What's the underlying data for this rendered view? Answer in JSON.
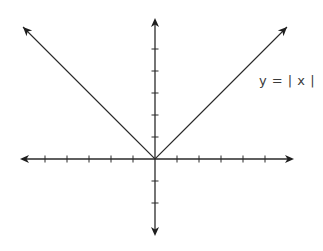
{
  "chart_data": {
    "type": "line",
    "title": "",
    "function_label": "y = | x |",
    "xlabel": "",
    "ylabel": "",
    "xlim": [
      -6,
      6
    ],
    "ylim": [
      -3.5,
      6.5
    ],
    "grid": false,
    "x_ticks": [
      -5,
      -4,
      -3,
      -2,
      -1,
      1,
      2,
      3,
      4,
      5
    ],
    "y_ticks": [
      -2,
      -1,
      1,
      2,
      3,
      4,
      5
    ],
    "tick_labels_shown": false,
    "series": [
      {
        "name": "y = |x|",
        "x": [
          -6,
          -5,
          -4,
          -3,
          -2,
          -1,
          0,
          1,
          2,
          3,
          4,
          5,
          6
        ],
        "y": [
          6,
          5,
          4,
          3,
          2,
          1,
          0,
          1,
          2,
          3,
          4,
          5,
          6
        ],
        "arrows_at_ends": true
      }
    ],
    "axes_arrows": true
  },
  "layout": {
    "origin_px": [
      155,
      159
    ],
    "unit_px": 22,
    "x_axis_px": [
      20,
      294
    ],
    "y_axis_px": [
      18,
      236
    ],
    "line_color": "#2a2a2a",
    "label_color": "#3a3a3a"
  }
}
